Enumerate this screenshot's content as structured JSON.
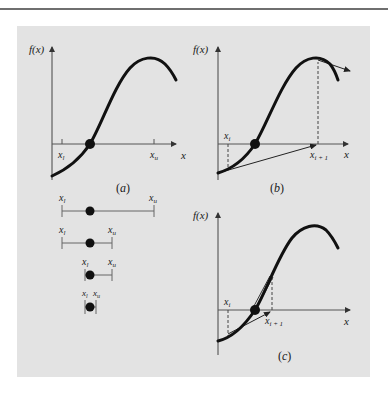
{
  "figure": {
    "background_color": "#e3e3e3",
    "curve_color": "#111111",
    "axis_color": "#555555",
    "panels": {
      "a": {
        "caption_open": "(",
        "caption_letter": "a",
        "caption_close": ")",
        "y_axis_label": "f(x)",
        "x_axis_label": "x",
        "lower_bound_label": "x",
        "lower_bound_sub": "l",
        "upper_bound_label": "x",
        "upper_bound_sub": "u"
      },
      "b": {
        "caption_open": "(",
        "caption_letter": "b",
        "caption_close": ")",
        "y_axis_label": "f(x)",
        "x_axis_label": "x",
        "xi_label": "x",
        "xi_sub": "i",
        "xi1_label": "x",
        "xi1_sub": "i + 1"
      },
      "c": {
        "caption_open": "(",
        "caption_letter": "c",
        "caption_close": ")",
        "y_axis_label": "f(x)",
        "x_axis_label": "x",
        "xi_label": "x",
        "xi_sub": "i",
        "xi1_label": "x",
        "xi1_sub": "i + 1"
      }
    },
    "bisection_intervals": [
      {
        "lower_label": "x",
        "lower_sub": "l",
        "upper_label": "x",
        "upper_sub": "u"
      },
      {
        "lower_label": "x",
        "lower_sub": "l",
        "upper_label": "x",
        "upper_sub": "u"
      },
      {
        "lower_label": "x",
        "lower_sub": "l",
        "upper_label": "x",
        "upper_sub": "u"
      },
      {
        "lower_label": "x",
        "lower_sub": "l",
        "upper_label": "x",
        "upper_sub": "u"
      }
    ]
  }
}
